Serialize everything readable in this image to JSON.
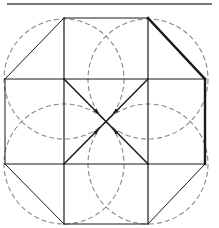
{
  "diagram": {
    "title": "",
    "type": "geometric-construction",
    "colors": {
      "background": "#ffffff",
      "solid_line": "#1a1a1a",
      "top_rule": "#777777",
      "dashed_circle": "#888888"
    },
    "top_rule": {
      "x1": 7,
      "y1": 4,
      "x2": 212,
      "y2": 4
    },
    "solid_lines": [
      {
        "id": "square-top",
        "x1": 64,
        "y1": 18,
        "x2": 148,
        "y2": 18,
        "w": 1.2
      },
      {
        "id": "square-bottom",
        "x1": 64,
        "y1": 224,
        "x2": 148,
        "y2": 224,
        "w": 1.2
      },
      {
        "id": "vert-left",
        "x1": 64,
        "y1": 18,
        "x2": 64,
        "y2": 224,
        "w": 1.2
      },
      {
        "id": "vert-right",
        "x1": 148,
        "y1": 18,
        "x2": 148,
        "y2": 224,
        "w": 1.2
      },
      {
        "id": "horiz-upper",
        "x1": 5,
        "y1": 79,
        "x2": 205,
        "y2": 79,
        "w": 1.2
      },
      {
        "id": "horiz-lower",
        "x1": 5,
        "y1": 164,
        "x2": 205,
        "y2": 164,
        "w": 1.2
      },
      {
        "id": "edge-left",
        "x1": 5,
        "y1": 79,
        "x2": 5,
        "y2": 164,
        "w": 1.0
      },
      {
        "id": "edge-right",
        "x1": 205,
        "y1": 79,
        "x2": 205,
        "y2": 164,
        "w": 2.4
      },
      {
        "id": "diag-top-left",
        "x1": 5,
        "y1": 79,
        "x2": 64,
        "y2": 18,
        "w": 1.0
      },
      {
        "id": "diag-top-right",
        "x1": 148,
        "y1": 18,
        "x2": 205,
        "y2": 79,
        "w": 2.4
      },
      {
        "id": "diag-bottom-left",
        "x1": 5,
        "y1": 164,
        "x2": 64,
        "y2": 224,
        "w": 1.0
      },
      {
        "id": "diag-bottom-right",
        "x1": 148,
        "y1": 224,
        "x2": 205,
        "y2": 164,
        "w": 1.0
      },
      {
        "id": "x-diag-a",
        "x1": 64,
        "y1": 79,
        "x2": 148,
        "y2": 164,
        "w": 1.5
      },
      {
        "id": "x-diag-b",
        "x1": 148,
        "y1": 79,
        "x2": 64,
        "y2": 164,
        "w": 1.5
      }
    ],
    "dashed_circles": [
      {
        "id": "circle-top-left",
        "cx": 64,
        "cy": 79,
        "r": 60
      },
      {
        "id": "circle-top-right",
        "cx": 148,
        "cy": 79,
        "r": 60
      },
      {
        "id": "circle-bottom-left",
        "cx": 64,
        "cy": 164,
        "r": 60
      },
      {
        "id": "circle-bottom-right",
        "cx": 148,
        "cy": 164,
        "r": 60
      }
    ],
    "arrowheads": [
      {
        "id": "arrow-nw",
        "x": 97,
        "y": 112,
        "angle": 45
      },
      {
        "id": "arrow-ne",
        "x": 115,
        "y": 112,
        "angle": 135
      },
      {
        "id": "arrow-sw",
        "x": 97,
        "y": 131,
        "angle": -45
      },
      {
        "id": "arrow-se",
        "x": 115,
        "y": 131,
        "angle": -135
      }
    ]
  }
}
